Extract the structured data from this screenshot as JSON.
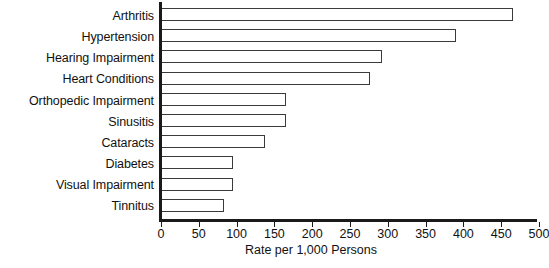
{
  "chart_data": {
    "type": "bar",
    "orientation": "horizontal",
    "title": "",
    "xlabel": "Rate per 1,000 Persons",
    "ylabel": "",
    "categories": [
      "Arthritis",
      "Hypertension",
      "Hearing Impairment",
      "Heart Conditions",
      "Orthopedic Impairment",
      "Sinusitis",
      "Cataracts",
      "Diabetes",
      "Visual Impairment",
      "Tinnitus"
    ],
    "values": [
      465,
      390,
      292,
      277,
      165,
      165,
      137,
      95,
      95,
      83
    ],
    "xlim": [
      0,
      500
    ],
    "xticks": [
      0,
      50,
      100,
      150,
      200,
      250,
      300,
      350,
      400,
      450,
      500
    ],
    "xtick_labels": [
      "0",
      "50",
      "100",
      "150",
      "200",
      "250",
      "300",
      "350",
      "400",
      "450",
      "500"
    ],
    "grid": false,
    "legend": null,
    "bar_fill_color": "#ffffff",
    "bar_edge_color": "#3a3a3a",
    "axis_color": "#1a1a1a",
    "background_color": "#ffffff"
  }
}
